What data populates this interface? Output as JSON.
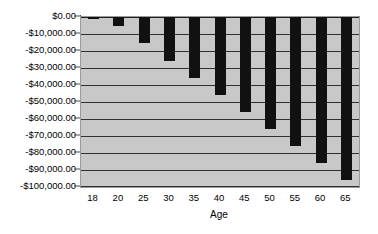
{
  "chart_data": {
    "type": "bar",
    "title": "",
    "xlabel": "Age",
    "ylabel": "",
    "categories": [
      "18",
      "20",
      "25",
      "30",
      "35",
      "40",
      "45",
      "50",
      "55",
      "60",
      "65"
    ],
    "values": [
      -1000,
      -5000,
      -15000,
      -26000,
      -36000,
      -46000,
      -56000,
      -66000,
      -76000,
      -86000,
      -96000
    ],
    "ylim": [
      -100000,
      0
    ],
    "y_ticks": [
      0,
      -10000,
      -20000,
      -30000,
      -40000,
      -50000,
      -60000,
      -70000,
      -80000,
      -90000,
      -100000
    ],
    "y_tick_labels": [
      "$0.00",
      "-$10,000.00",
      "-$20,000.00",
      "-$30,000.00",
      "-$40,000.00",
      "-$50,000.00",
      "-$60,000.00",
      "-$70,000.00",
      "-$80,000.00",
      "-$90,000.00",
      "-$100,000.00"
    ],
    "grid": true,
    "legend": "none",
    "series": [
      {
        "name": "",
        "values": [
          -1000,
          -5000,
          -15000,
          -26000,
          -36000,
          -46000,
          -56000,
          -66000,
          -76000,
          -86000,
          -96000
        ]
      }
    ],
    "colors": {
      "bar": "#111111",
      "plot_background": "#c8c8c8",
      "gridline": "#303030",
      "axis": "#4a4a4a",
      "figure_background": "#ffffff",
      "text": "#000000"
    }
  }
}
